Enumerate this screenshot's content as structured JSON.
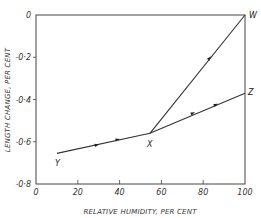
{
  "chart_data": {
    "type": "line",
    "title": "",
    "xlabel": "RELATIVE HUMIDITY, PER CENT",
    "ylabel": "LENGTH CHANGE, PER CENT",
    "xlim": [
      0,
      100
    ],
    "ylim": [
      -0.8,
      0
    ],
    "x_ticks": [
      0,
      20,
      40,
      60,
      80,
      100
    ],
    "x_tick_labels": [
      "0",
      "20",
      "40",
      "60",
      "80",
      "100"
    ],
    "y_ticks": [
      0,
      -0.2,
      -0.4,
      -0.6,
      -0.8
    ],
    "y_tick_labels": [
      "0",
      "-0·2",
      "-0·4",
      "-0·6",
      "-0·8"
    ],
    "grid": false,
    "boxed": true,
    "points": [
      {
        "label": "Y",
        "x": 10,
        "y": -0.655
      },
      {
        "label": "X",
        "x": 54.5,
        "y": -0.56
      },
      {
        "label": "Z",
        "x": 100,
        "y": -0.37
      },
      {
        "label": "W",
        "x": 100,
        "y": 0.0
      }
    ],
    "series": [
      {
        "name": "Y-X-Z",
        "x": [
          10,
          54.5,
          100
        ],
        "y": [
          -0.655,
          -0.56,
          -0.37
        ],
        "arrows": [
          [
            29,
            -0.615
          ],
          [
            39,
            -0.59
          ],
          [
            75,
            -0.465
          ],
          [
            86,
            -0.425
          ]
        ]
      },
      {
        "name": "X-W",
        "x": [
          54.5,
          100
        ],
        "y": [
          -0.56,
          0.0
        ],
        "arrows": [
          [
            83,
            -0.205
          ]
        ]
      }
    ]
  }
}
